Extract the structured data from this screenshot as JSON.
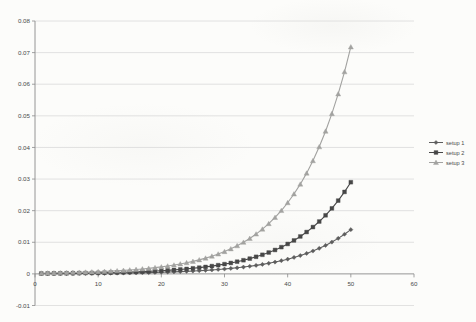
{
  "chart_data": {
    "type": "line",
    "title": "",
    "xlabel": "",
    "ylabel": "",
    "xlim": [
      0,
      60
    ],
    "ylim": [
      -0.01,
      0.08
    ],
    "x_ticks": [
      0,
      10,
      20,
      30,
      40,
      50,
      60
    ],
    "x_tick_labels": [
      "0",
      "10",
      "20",
      "30",
      "40",
      "50",
      "60"
    ],
    "y_ticks": [
      -0.01,
      0,
      0.01,
      0.02,
      0.03,
      0.04,
      0.05,
      0.06,
      0.07,
      0.08
    ],
    "y_tick_labels": [
      "-0.01",
      "0",
      "0.01",
      "0.02",
      "0.03",
      "0.04",
      "0.05",
      "0.06",
      "0.07",
      "0.08"
    ],
    "grid": "horizontal",
    "legend_position": "right-outside",
    "x": [
      1,
      2,
      3,
      4,
      5,
      6,
      7,
      8,
      9,
      10,
      11,
      12,
      13,
      14,
      15,
      16,
      17,
      18,
      19,
      20,
      21,
      22,
      23,
      24,
      25,
      26,
      27,
      28,
      29,
      30,
      31,
      32,
      33,
      34,
      35,
      36,
      37,
      38,
      39,
      40,
      41,
      42,
      43,
      44,
      45,
      46,
      47,
      48,
      49,
      50
    ],
    "series": [
      {
        "name": "setup 1",
        "marker": "diamond",
        "color": "#5d5d5d",
        "values": [
          6.4e-05,
          7.1e-05,
          8e-05,
          8.9e-05,
          9.9e-05,
          0.000111,
          0.000124,
          0.000138,
          0.000154,
          0.000172,
          0.000192,
          0.000214,
          0.000239,
          0.000267,
          0.000298,
          0.000333,
          0.000371,
          0.000414,
          0.000463,
          0.000516,
          0.000576,
          0.000643,
          0.000718,
          0.000802,
          0.000895,
          0.000999,
          0.001115,
          0.001245,
          0.00139,
          0.001551,
          0.001732,
          0.001933,
          0.002158,
          0.002409,
          0.002689,
          0.003001,
          0.00335,
          0.00374,
          0.004175,
          0.00466,
          0.005202,
          0.005807,
          0.006482,
          0.007236,
          0.008077,
          0.009016,
          0.010065,
          0.011235,
          0.012541,
          0.014
        ]
      },
      {
        "name": "setup 2",
        "marker": "square",
        "color": "#474747",
        "values": [
          0.00012,
          0.000134,
          0.00015,
          0.000168,
          0.000188,
          0.00021,
          0.000235,
          0.000263,
          0.000294,
          0.000329,
          0.000368,
          0.000411,
          0.00046,
          0.000514,
          0.000575,
          0.000644,
          0.00072,
          0.000805,
          0.000901,
          0.001007,
          0.001127,
          0.00126,
          0.00141,
          0.001577,
          0.001764,
          0.001973,
          0.002206,
          0.002468,
          0.00276,
          0.003087,
          0.003453,
          0.003863,
          0.00432,
          0.004832,
          0.005405,
          0.006046,
          0.006762,
          0.007564,
          0.00846,
          0.009463,
          0.010584,
          0.011839,
          0.013242,
          0.014811,
          0.016566,
          0.01853,
          0.020726,
          0.023182,
          0.025929,
          0.029
        ]
      },
      {
        "name": "setup 3",
        "marker": "triangle",
        "color": "#a2a2a0",
        "values": [
          0.000244,
          0.000274,
          0.000308,
          0.000346,
          0.000388,
          0.000436,
          0.00049,
          0.00055,
          0.000617,
          0.000693,
          0.000779,
          0.000874,
          0.000982,
          0.001103,
          0.001238,
          0.001391,
          0.001562,
          0.001754,
          0.00197,
          0.002212,
          0.002484,
          0.002789,
          0.003132,
          0.003518,
          0.00395,
          0.004436,
          0.004982,
          0.005595,
          0.006283,
          0.007055,
          0.007923,
          0.008898,
          0.009992,
          0.011221,
          0.012601,
          0.014151,
          0.015892,
          0.017846,
          0.020041,
          0.022506,
          0.025274,
          0.028382,
          0.031873,
          0.035794,
          0.040196,
          0.04514,
          0.050692,
          0.056927,
          0.063928,
          0.071791
        ]
      }
    ],
    "colors": {
      "gridline": "#dadada",
      "axis_line": "#8a8a8a",
      "tick_label": "#4a4a4a",
      "background": "#fcfcfa"
    }
  },
  "legend": {
    "items": [
      {
        "label": "setup 1"
      },
      {
        "label": "setup 2"
      },
      {
        "label": "setup 3"
      }
    ]
  }
}
